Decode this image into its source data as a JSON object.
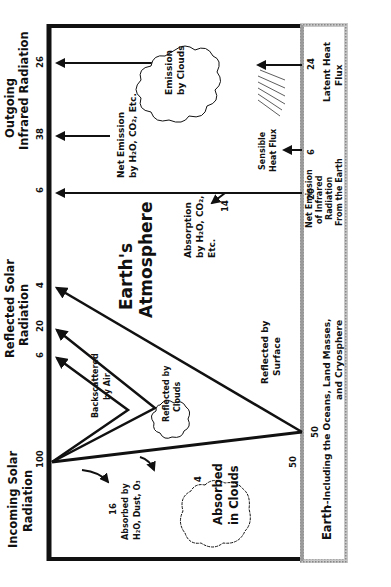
{
  "headers": {
    "incoming": [
      "Incoming Solar",
      "Radiation"
    ],
    "reflected": [
      "Reflected Solar",
      "Radiation"
    ],
    "outgoing": [
      "Outgoing",
      "Infrared Radiation"
    ]
  },
  "values": {
    "incoming_total": "100",
    "backscattered": "6",
    "reflected_clouds": "20",
    "reflected_surface": "4",
    "ir_net_h2o": "6",
    "ir_net_emission": "38",
    "ir_clouds": "26",
    "absorbed_h2o": "16",
    "absorbed_clouds": "4",
    "surface_absorbed": "50",
    "absorption_h2o": "14",
    "earth_net_ir": "20",
    "sensible_heat": "6",
    "latent_heat": "24"
  },
  "labels": {
    "atmosphere": [
      "Earth's",
      "Atmosphere"
    ],
    "backscattered": [
      "Backscattered",
      "by Air"
    ],
    "reflected_clouds": [
      "Reflected by",
      "Clouds"
    ],
    "reflected_surface": [
      "Reflected by",
      "Surface"
    ],
    "absorbed_h2o": [
      "Absorbed by",
      "H₂O, Dust, O₃"
    ],
    "absorbed_clouds": [
      "Absorbed",
      "in Clouds"
    ],
    "absorption_h2o": [
      "Absorption",
      "by H₂O, CO₂,",
      "Etc."
    ],
    "net_emission": [
      "Net Emission",
      "by H₂O, CO₂, Etc."
    ],
    "emission_clouds": [
      "Emission",
      "by Clouds"
    ],
    "sensible_heat": [
      "Sensible",
      "Heat Flux"
    ],
    "net_ir_earth": [
      "Net Emission",
      "of Infrared",
      "Radiation",
      "From the Earth"
    ],
    "latent_heat": [
      "Latent Heat",
      "Flux"
    ],
    "earth_title": "Earth",
    "earth_sub": [
      "--Including the Oceans, Land Masses,",
      "and Cryosphere"
    ]
  },
  "colors": {
    "ink": "#111111",
    "earth_border": "#9a9a9a"
  }
}
